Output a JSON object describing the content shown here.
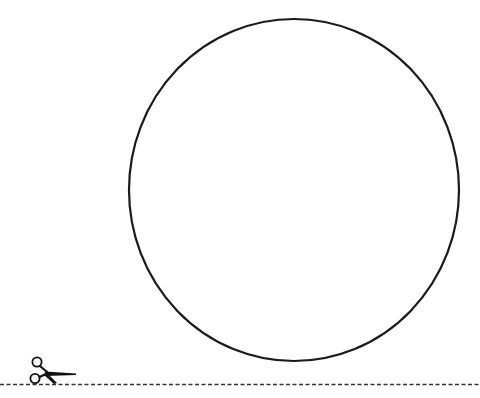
{
  "worksheet": {
    "title": "Cut-out circle template",
    "shape": {
      "type": "circle",
      "stroke_color": "#1a1a1a",
      "fill_color": "#ffffff",
      "center_x": 294,
      "center_y": 190,
      "radius_x": 165,
      "radius_y": 171,
      "stroke_width": 2.2
    },
    "cut_line": {
      "style": "dashed",
      "y": 384,
      "color": "#333333",
      "dash": "4 2.5"
    },
    "icons": {
      "scissors": "scissors-icon"
    },
    "colors": {
      "background": "#ffffff",
      "ink": "#1a1a1a"
    }
  }
}
